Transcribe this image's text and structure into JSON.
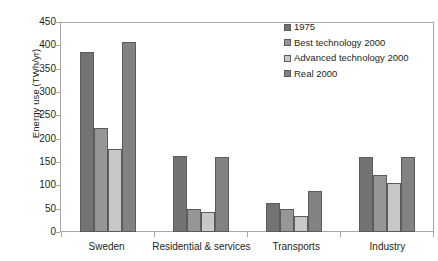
{
  "chart_data": {
    "type": "bar",
    "title": "",
    "xlabel": "",
    "ylabel": "Energy use (TWh/yr)",
    "ylim": [
      0,
      450
    ],
    "ytick_step": 50,
    "yticks": [
      450,
      400,
      350,
      300,
      250,
      200,
      150,
      100,
      50,
      0
    ],
    "grid": false,
    "legend_position": "top-right",
    "categories": [
      "Sweden",
      "Residential & services",
      "Transports",
      "Industry"
    ],
    "series": [
      {
        "name": "1975",
        "color": "#737373",
        "values": [
          385,
          163,
          62,
          161
        ]
      },
      {
        "name": "Best technology 2000",
        "color": "#969696",
        "values": [
          222,
          50,
          50,
          122
        ]
      },
      {
        "name": "Advanced technology 2000",
        "color": "#c8c8c8",
        "values": [
          178,
          42,
          35,
          106
        ]
      },
      {
        "name": "Real 2000",
        "color": "#828282",
        "values": [
          407,
          160,
          88,
          161
        ]
      }
    ]
  },
  "colors": {
    "axis": "#a6a6a6",
    "bar_outline": "#5c5c5c",
    "text": "#231f20",
    "background": "#ffffff"
  }
}
